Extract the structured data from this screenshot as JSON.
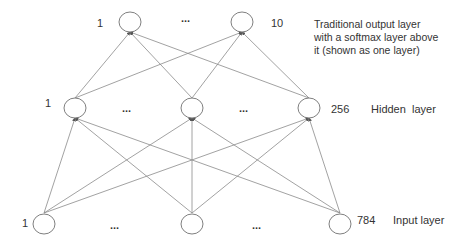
{
  "diagram": {
    "type": "neural-network",
    "layers": [
      {
        "name": "output",
        "description": "Traditional output layer with a softmax layer above it (shown as one layer)",
        "description_lines": [
          "Traditional output layer",
          "with a softmax layer above",
          "it (shown as one layer)"
        ],
        "first_index": "1",
        "last_index": "10",
        "ellipsis": "...",
        "nodes": [
          {
            "x": 130,
            "y": 22
          },
          {
            "x": 242,
            "y": 22
          }
        ]
      },
      {
        "name": "hidden",
        "description": "Hidden  layer",
        "first_index": "1",
        "last_index": "256",
        "ellipsis_left": "...",
        "ellipsis_right": "...",
        "nodes": [
          {
            "x": 75,
            "y": 108
          },
          {
            "x": 192,
            "y": 108
          },
          {
            "x": 309,
            "y": 108
          }
        ]
      },
      {
        "name": "input",
        "description": "Input layer",
        "first_index": "1",
        "last_index": "784",
        "ellipsis_left": "...",
        "ellipsis_right": "...",
        "nodes": [
          {
            "x": 44,
            "y": 224
          },
          {
            "x": 192,
            "y": 224
          },
          {
            "x": 340,
            "y": 224
          }
        ]
      }
    ],
    "edge_color": "#7f7f7f",
    "node_stroke": "#7f7f7f",
    "text_color": "#333333"
  }
}
